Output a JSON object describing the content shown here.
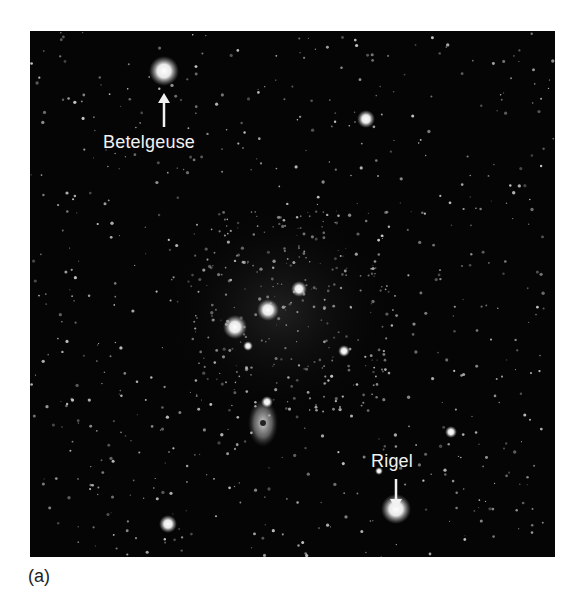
{
  "figure": {
    "caption": "(a)",
    "labels": [
      {
        "text": "Betelgeuse",
        "arrow_direction": "up"
      },
      {
        "text": "Rigel",
        "arrow_direction": "down"
      }
    ]
  },
  "colors": {
    "sky": "#050505",
    "star": "#ffffff",
    "label": "#f2f2f2",
    "page": "#ffffff"
  }
}
